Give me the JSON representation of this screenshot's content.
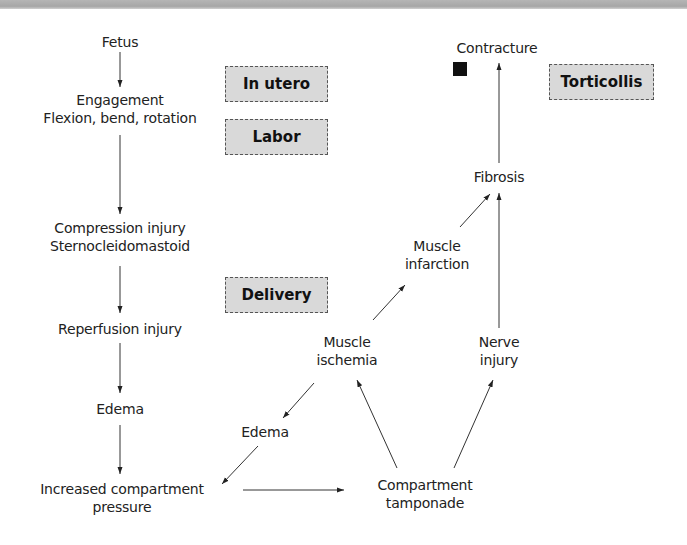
{
  "header": {
    "bar_color": "#aaaaaa"
  },
  "stage_labels": {
    "in_utero": "In utero",
    "labor": "Labor",
    "delivery": "Delivery",
    "torticollis": "Torticollis"
  },
  "nodes": {
    "fetus": "Fetus",
    "engagement_line1": "Engagement",
    "engagement_line2": "Flexion, bend, rotation",
    "compression_line1": "Compression injury",
    "compression_line2": "Sternocleidomastoid",
    "reperfusion": "Reperfusion injury",
    "edema_left": "Edema",
    "icp_line1": "Increased compartment",
    "icp_line2": "pressure",
    "edema_mid": "Edema",
    "ischemia_line1": "Muscle",
    "ischemia_line2": "ischemia",
    "infarction_line1": "Muscle",
    "infarction_line2": "infarction",
    "nerve_line1": "Nerve",
    "nerve_line2": "injury",
    "tamponade_line1": "Compartment",
    "tamponade_line2": "tamponade",
    "fibrosis": "Fibrosis",
    "contracture": "Contracture"
  },
  "edges": [
    {
      "from": "Fetus",
      "to": "Engagement"
    },
    {
      "from": "Engagement",
      "to": "Compression injury"
    },
    {
      "from": "Compression injury",
      "to": "Reperfusion injury"
    },
    {
      "from": "Reperfusion injury",
      "to": "Edema"
    },
    {
      "from": "Edema",
      "to": "Increased compartment pressure"
    },
    {
      "from": "Increased compartment pressure",
      "to": "Compartment tamponade"
    },
    {
      "from": "Compartment tamponade",
      "to": "Muscle ischemia"
    },
    {
      "from": "Compartment tamponade",
      "to": "Nerve injury"
    },
    {
      "from": "Muscle ischemia",
      "to": "Edema (mid)"
    },
    {
      "from": "Edema (mid)",
      "to": "Increased compartment pressure"
    },
    {
      "from": "Muscle ischemia",
      "to": "Muscle infarction"
    },
    {
      "from": "Muscle infarction",
      "to": "Fibrosis"
    },
    {
      "from": "Nerve injury",
      "to": "Fibrosis"
    },
    {
      "from": "Fibrosis",
      "to": "Contracture"
    }
  ]
}
